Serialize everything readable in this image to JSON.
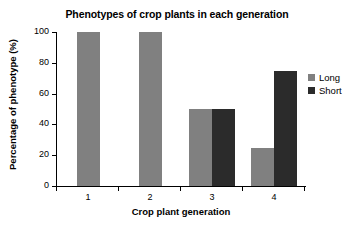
{
  "chart_data": {
    "type": "bar",
    "title": "Phenotypes of crop plants in each generation",
    "xlabel": "Crop plant generation",
    "ylabel": "Percentage of phenotype (%)",
    "categories": [
      "1",
      "2",
      "3",
      "4"
    ],
    "series": [
      {
        "name": "Long",
        "color": "#808080",
        "values": [
          100,
          100,
          50,
          25
        ]
      },
      {
        "name": "Short",
        "color": "#2b2b2b",
        "values": [
          0,
          0,
          50,
          75
        ]
      }
    ],
    "ylim": [
      0,
      100
    ],
    "yticks": [
      0,
      20,
      40,
      60,
      80,
      100
    ],
    "ytick_labels": [
      "0",
      "20",
      "40",
      "60",
      "80",
      "100"
    ],
    "xtick_labels": [
      "1",
      "2",
      "3",
      "4"
    ],
    "grid": false,
    "legend_position": "right"
  }
}
